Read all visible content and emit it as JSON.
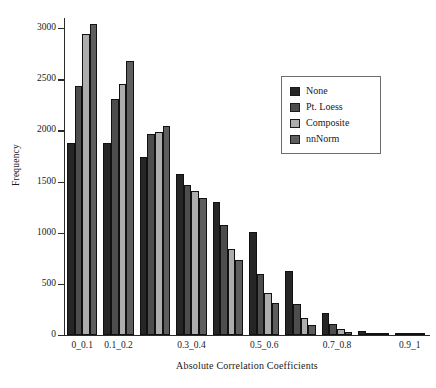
{
  "chart_data": {
    "type": "bar",
    "title": "",
    "xlabel": "Absolute Correlation Coefficients",
    "ylabel": "Frequency",
    "ylim": [
      0,
      3100
    ],
    "yticks": [
      0,
      500,
      1000,
      1500,
      2000,
      2500,
      3000
    ],
    "ytick_labels": [
      "0",
      "500",
      "1000",
      "1500",
      "2000",
      "2500",
      "3000"
    ],
    "grid": false,
    "legend_position": "upper right",
    "categories": [
      "0_0.1",
      "0.1_0.2",
      "0.2_0.3",
      "0.3_0.4",
      "0.4_0.5",
      "0.5_0.6",
      "0.6_0.7",
      "0.7_0.8",
      "0.8_0.9",
      "0.9_1"
    ],
    "visible_xtick_labels": [
      "0_0.1",
      "0.1_0.2",
      "",
      "0.3_0.4",
      "",
      "0.5_0.6",
      "",
      "0.7_0.8",
      "",
      "0.9_1"
    ],
    "series": [
      {
        "name": "None",
        "color": "#262626",
        "values": [
          1880,
          1875,
          1740,
          1570,
          1305,
          1005,
          630,
          215,
          40,
          5
        ]
      },
      {
        "name": "Pt. Loess",
        "color": "#4d4d4d",
        "values": [
          2435,
          2310,
          1965,
          1465,
          1080,
          595,
          305,
          105,
          12,
          2
        ]
      },
      {
        "name": "Composite",
        "color": "#adadad",
        "values": [
          2940,
          2455,
          1990,
          1405,
          845,
          410,
          170,
          55,
          5,
          1
        ]
      },
      {
        "name": "nnNorm",
        "color": "#5e5e5e",
        "values": [
          3045,
          2680,
          2045,
          1340,
          730,
          315,
          100,
          30,
          3,
          1
        ]
      }
    ]
  }
}
